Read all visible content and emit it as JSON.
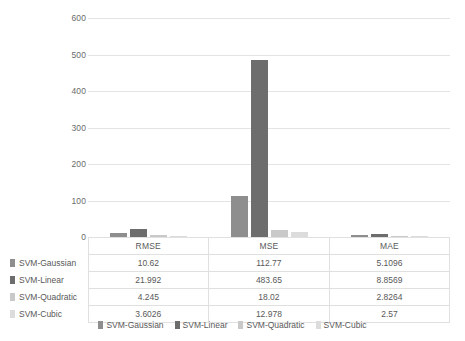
{
  "chart_data": {
    "type": "bar",
    "title": "",
    "subtitle": "",
    "xlabel": "",
    "ylabel": "",
    "categories": [
      "RMSE",
      "MSE",
      "MAE"
    ],
    "series": [
      {
        "name": "SVM-Gaussian",
        "color": "#8e8e8e",
        "values": [
          10.62,
          112.77,
          5.1096
        ]
      },
      {
        "name": "SVM-Linear",
        "color": "#6d6d6d",
        "values": [
          21.992,
          483.65,
          8.8569
        ]
      },
      {
        "name": "SVM-Quadratic",
        "color": "#c9c9c9",
        "values": [
          4.245,
          18.02,
          2.8264
        ]
      },
      {
        "name": "SVM-Cubic",
        "color": "#dcdcdc",
        "values": [
          3.6026,
          12.978,
          2.57
        ]
      }
    ],
    "ylim": [
      0,
      600
    ],
    "yticks": [
      0,
      100,
      200,
      300,
      400,
      500,
      600
    ],
    "ytick_labels": [
      "0",
      "100",
      "200",
      "300",
      "400",
      "500",
      "600"
    ],
    "grid": true,
    "legend_position": "bottom",
    "data_table_visible": true,
    "cell_text": {
      "SVM-Gaussian": [
        "10.62",
        "112.77",
        "5.1096"
      ],
      "SVM-Linear": [
        "21.992",
        "483.65",
        "8.8569"
      ],
      "SVM-Quadratic": [
        "4.245",
        "18.02",
        "2.8264"
      ],
      "SVM-Cubic": [
        "3.6026",
        "12.978",
        "2.57"
      ]
    }
  },
  "axis": {
    "y_ticks": [
      {
        "label": "600",
        "value": 600
      },
      {
        "label": "500",
        "value": 500
      },
      {
        "label": "400",
        "value": 400
      },
      {
        "label": "300",
        "value": 300
      },
      {
        "label": "200",
        "value": 200
      },
      {
        "label": "100",
        "value": 100
      },
      {
        "label": "0",
        "value": 0
      }
    ]
  },
  "table": {
    "column_headers": [
      "RMSE",
      "MSE",
      "MAE"
    ],
    "rows": [
      {
        "label": "SVM-Gaussian",
        "cells": [
          "10.62",
          "112.77",
          "5.1096"
        ]
      },
      {
        "label": "SVM-Linear",
        "cells": [
          "21.992",
          "483.65",
          "8.8569"
        ]
      },
      {
        "label": "SVM-Quadratic",
        "cells": [
          "4.245",
          "18.02",
          "2.8264"
        ]
      },
      {
        "label": "SVM-Cubic",
        "cells": [
          "3.6026",
          "12.978",
          "2.57"
        ]
      }
    ]
  },
  "legend": {
    "items": [
      {
        "label": "SVM-Gaussian"
      },
      {
        "label": "SVM-Linear"
      },
      {
        "label": "SVM-Quadratic"
      },
      {
        "label": "SVM-Cubic"
      }
    ]
  }
}
